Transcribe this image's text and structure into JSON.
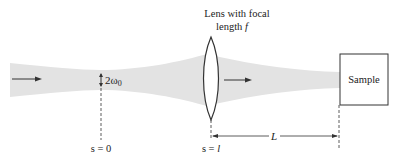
{
  "diagram": {
    "type": "gaussian-beam-focusing",
    "labels": {
      "lens_line1": "Lens with focal",
      "lens_line2_prefix": "length ",
      "lens_focal_symbol": "f",
      "waist_prefix": "2ω",
      "waist_subscript": "0",
      "s_zero": "s = 0",
      "s_l_prefix": "s = ",
      "s_l_symbol": "l",
      "distance": "L",
      "sample": "Sample"
    },
    "colors": {
      "beam": "#e3e3e3",
      "stroke": "#333333",
      "text": "#222222"
    }
  }
}
